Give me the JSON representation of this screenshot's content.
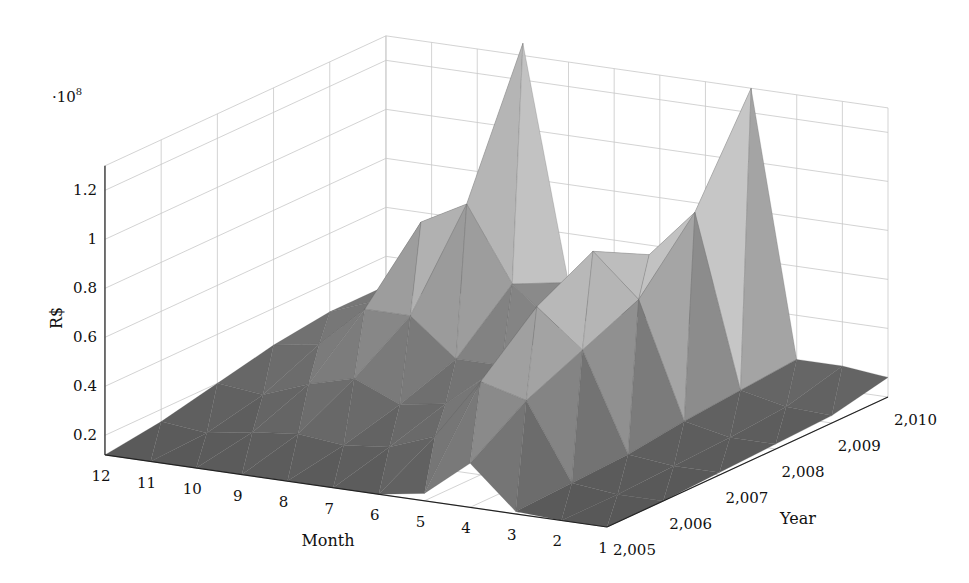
{
  "chart_data": {
    "type": "surface3d",
    "title": "",
    "xlabel": "Month",
    "ylabel": "Year",
    "zlabel": "R$",
    "z_multiplier_label": "·10",
    "z_multiplier_exp": "8",
    "x_ticks": [
      "12",
      "11",
      "10",
      "9",
      "8",
      "7",
      "6",
      "5",
      "4",
      "3",
      "2",
      "1"
    ],
    "y_ticks": [
      "2,005",
      "2,006",
      "2,007",
      "2,008",
      "2,009",
      "2,010"
    ],
    "z_ticks": [
      "0.2",
      "0.4",
      "0.6",
      "0.8",
      "1",
      "1.2"
    ],
    "zlim": [
      0.1,
      1.3
    ],
    "grid": true,
    "colormap": "gray",
    "months": [
      1,
      2,
      3,
      4,
      5,
      6,
      7,
      8,
      9,
      10,
      11,
      12
    ],
    "years": [
      2005,
      2006,
      2007,
      2008,
      2009,
      2010
    ],
    "z_values_1e8": [
      [
        0.12,
        0.12,
        0.13,
        0.14,
        0.15,
        0.2
      ],
      [
        0.12,
        0.12,
        0.13,
        0.14,
        0.16,
        0.22
      ],
      [
        0.13,
        0.14,
        0.15,
        0.18,
        0.2,
        0.22
      ],
      [
        0.3,
        0.45,
        0.55,
        0.65,
        0.9,
        1.3
      ],
      [
        0.15,
        0.5,
        0.7,
        0.82,
        0.7,
        0.3
      ],
      [
        0.12,
        0.25,
        0.4,
        0.55,
        0.5,
        0.3
      ],
      [
        0.12,
        0.18,
        0.25,
        0.3,
        0.35,
        0.3
      ],
      [
        0.12,
        0.16,
        0.22,
        0.3,
        0.5,
        0.4
      ],
      [
        0.12,
        0.18,
        0.3,
        0.45,
        0.8,
        1.35
      ],
      [
        0.12,
        0.16,
        0.25,
        0.45,
        0.7,
        0.3
      ],
      [
        0.12,
        0.13,
        0.18,
        0.28,
        0.35,
        0.28
      ],
      [
        0.12,
        0.15,
        0.2,
        0.25,
        0.28,
        0.28
      ]
    ]
  }
}
